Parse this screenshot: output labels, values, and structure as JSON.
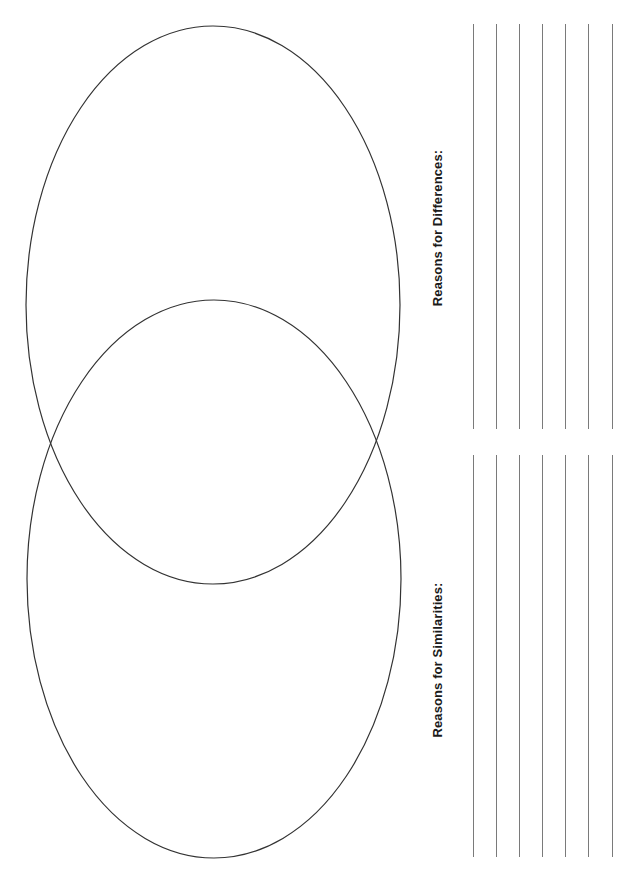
{
  "worksheet": {
    "type": "venn-diagram-worksheet",
    "orientation": "rotated-90-ccw",
    "colors": {
      "background": "#ffffff",
      "circle_stroke": "#333333",
      "writing_line": "#7a7a7a",
      "label_text": "#1a1a1a"
    },
    "venn": {
      "circles": [
        {
          "name": "top-circle",
          "cx": 213,
          "cy": 305,
          "rx": 187,
          "ry": 279
        },
        {
          "name": "bottom-circle",
          "cx": 214,
          "cy": 579,
          "rx": 187,
          "ry": 279
        }
      ]
    },
    "sections": {
      "differences": {
        "label": "Reasons for Differences:",
        "label_x": 437,
        "label_y": 228,
        "line_top": 24,
        "line_bottom": 429,
        "line_count": 7
      },
      "similarities": {
        "label": "Reasons for Similarities:",
        "label_x": 437,
        "label_y": 660,
        "line_top": 455,
        "line_bottom": 857,
        "line_count": 7
      }
    },
    "line_x_positions": [
      473,
      496,
      519,
      542,
      565,
      588,
      612
    ]
  }
}
